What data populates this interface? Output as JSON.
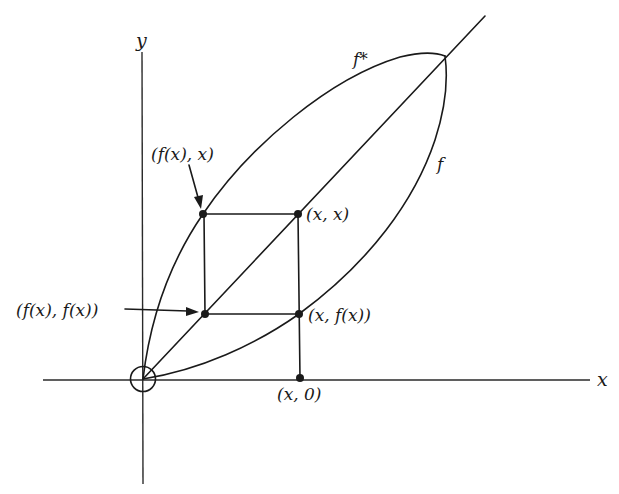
{
  "diagram": {
    "axes": {
      "x_label": "x",
      "y_label": "y"
    },
    "curves": {
      "f_star_label": "f*",
      "f_label": "f"
    },
    "points": {
      "fx_x": "(f(x), x)",
      "x_x": "(x, x)",
      "fx_fx": "(f(x), f(x))",
      "x_fx": "(x, f(x))",
      "x_0": "(x, 0)"
    },
    "colors": {
      "ink": "#1a1a1a",
      "background": "#ffffff"
    }
  }
}
